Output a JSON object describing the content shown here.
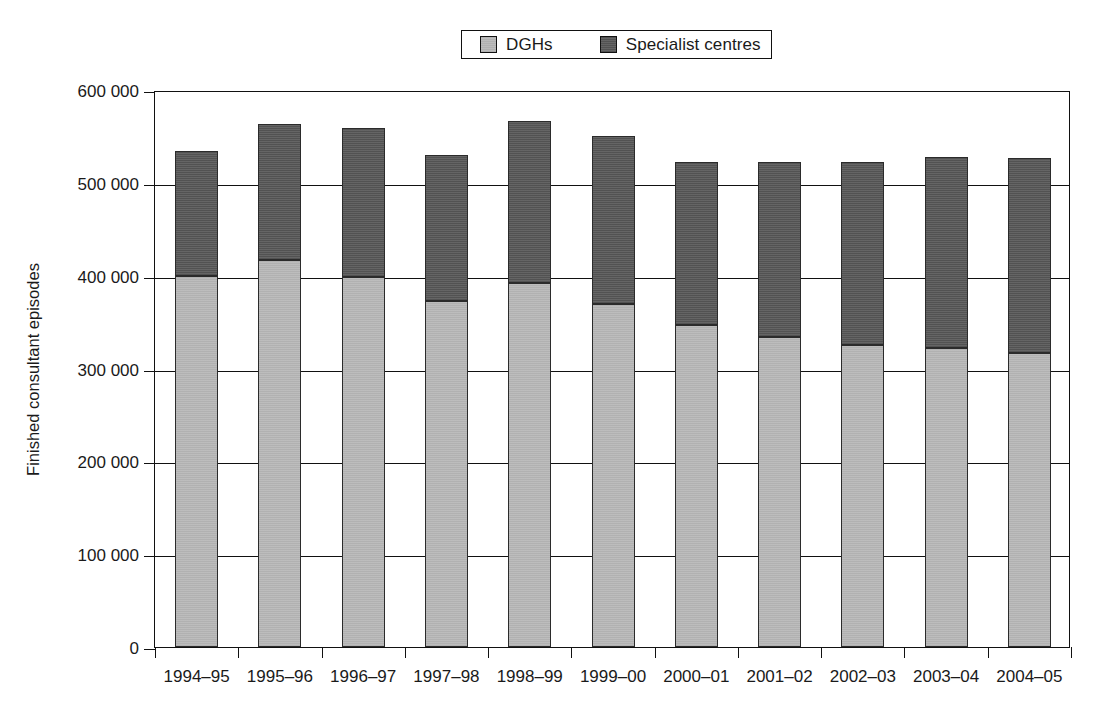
{
  "chart_data": {
    "type": "bar",
    "barmode": "stacked",
    "title": "",
    "xlabel": "",
    "ylabel": "Finished consultant episodes",
    "ylim": [
      0,
      600000
    ],
    "ytick_step": 100000,
    "ytick_labels": [
      "0",
      "100 000",
      "200 000",
      "300 000",
      "400 000",
      "500 000",
      "600 000"
    ],
    "ytick_values": [
      0,
      100000,
      200000,
      300000,
      400000,
      500000,
      600000
    ],
    "grid": true,
    "legend_position": "top-center",
    "categories": [
      "1994–95",
      "1995–96",
      "1996–97",
      "1997–98",
      "1998–99",
      "1999–00",
      "2000–01",
      "2001–02",
      "2002–03",
      "2003–04",
      "2004–05"
    ],
    "series": [
      {
        "name": "DGHs",
        "color": "#b9b9b9",
        "values": [
          400000,
          417000,
          399000,
          373000,
          392000,
          369000,
          347000,
          334000,
          325000,
          322000,
          317000
        ]
      },
      {
        "name": "Specialist centres",
        "color": "#595959",
        "values": [
          134000,
          146000,
          160000,
          157000,
          175000,
          181000,
          175000,
          188000,
          197000,
          206000,
          210000
        ]
      }
    ],
    "totals": [
      534000,
      563000,
      559000,
      530000,
      567000,
      550000,
      522000,
      522000,
      522000,
      528000,
      527000
    ]
  },
  "legend": {
    "entries": [
      {
        "label": "DGHs",
        "swatch": "light-gray-swatch"
      },
      {
        "label": "Specialist centres",
        "swatch": "dark-gray-swatch"
      }
    ]
  }
}
